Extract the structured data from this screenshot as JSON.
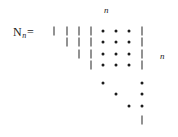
{
  "figure": {
    "type": "matrix-diagram",
    "background_color": "#ffffff",
    "ink_color": "#1a1a1a",
    "width": 178,
    "height": 137
  },
  "matrix_label": {
    "variable": "N",
    "subscript": "n",
    "equals": "="
  },
  "dimension_labels": {
    "top": "n",
    "right": "n"
  },
  "grid": {
    "columns": 8,
    "rows": 8,
    "column_x": [
      54,
      67,
      79,
      91,
      103,
      116,
      129,
      142
    ],
    "row_y": [
      31,
      42,
      54,
      65,
      83,
      94,
      106,
      120
    ],
    "glyph_types": [
      "bar",
      "dot",
      "empty"
    ]
  },
  "cells": [
    [
      "bar",
      "bar",
      "bar",
      "bar",
      "dot",
      "dot",
      "dot",
      "bar"
    ],
    [
      "empty",
      "bar",
      "bar",
      "bar",
      "dot",
      "dot",
      "dot",
      "bar"
    ],
    [
      "empty",
      "empty",
      "bar",
      "bar",
      "dot",
      "dot",
      "dot",
      "bar"
    ],
    [
      "empty",
      "empty",
      "empty",
      "bar",
      "dot",
      "dot",
      "dot",
      "bar"
    ],
    [
      "empty",
      "empty",
      "empty",
      "empty",
      "dot",
      "empty",
      "empty",
      "dot"
    ],
    [
      "empty",
      "empty",
      "empty",
      "empty",
      "empty",
      "dot",
      "empty",
      "dot"
    ],
    [
      "empty",
      "empty",
      "empty",
      "empty",
      "empty",
      "empty",
      "dot",
      "dot"
    ],
    [
      "empty",
      "empty",
      "empty",
      "empty",
      "empty",
      "empty",
      "empty",
      "bar"
    ]
  ]
}
